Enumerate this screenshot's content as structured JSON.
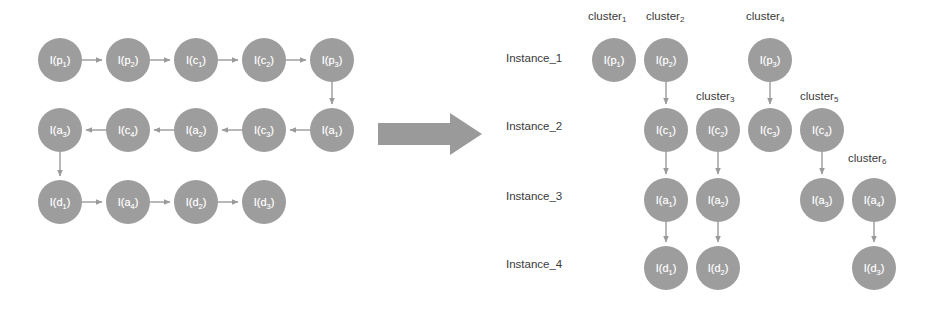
{
  "diagram": {
    "colors": {
      "node_fill": "#9d9d9d",
      "node_text": "#ffffff",
      "edge": "#9a9a9a",
      "label_text": "#3a3a3a",
      "big_arrow": "#9a9a9a",
      "background": "#ffffff"
    },
    "left_graph": {
      "name": "source-event-log-graph",
      "rows": [
        {
          "direction": "left-to-right",
          "nodes": [
            {
              "id": "L-p1",
              "base": "I(p",
              "sub": "1",
              "close": ")",
              "x": 38,
              "y": 38
            },
            {
              "id": "L-p2",
              "base": "I(p",
              "sub": "2",
              "close": ")",
              "x": 106,
              "y": 38
            },
            {
              "id": "L-c1",
              "base": "I(c",
              "sub": "1",
              "close": ")",
              "x": 174,
              "y": 38
            },
            {
              "id": "L-c2",
              "base": "I(c",
              "sub": "2",
              "close": ")",
              "x": 242,
              "y": 38
            },
            {
              "id": "L-p3",
              "base": "I(p",
              "sub": "3",
              "close": ")",
              "x": 310,
              "y": 38
            }
          ]
        },
        {
          "direction": "right-to-left",
          "nodes": [
            {
              "id": "L-a3",
              "base": "I(a",
              "sub": "3",
              "close": ")",
              "x": 38,
              "y": 108
            },
            {
              "id": "L-c4",
              "base": "I(c",
              "sub": "4",
              "close": ")",
              "x": 106,
              "y": 108
            },
            {
              "id": "L-a2",
              "base": "I(a",
              "sub": "2",
              "close": ")",
              "x": 174,
              "y": 108
            },
            {
              "id": "L-c3",
              "base": "I(c",
              "sub": "3",
              "close": ")",
              "x": 242,
              "y": 108
            },
            {
              "id": "L-a1",
              "base": "I(a",
              "sub": "1",
              "close": ")",
              "x": 310,
              "y": 108
            }
          ]
        },
        {
          "direction": "left-to-right",
          "nodes": [
            {
              "id": "L-d1",
              "base": "I(d",
              "sub": "1",
              "close": ")",
              "x": 38,
              "y": 180
            },
            {
              "id": "L-a4",
              "base": "I(a",
              "sub": "4",
              "close": ")",
              "x": 106,
              "y": 180
            },
            {
              "id": "L-d2",
              "base": "I(d",
              "sub": "2",
              "close": ")",
              "x": 174,
              "y": 180
            },
            {
              "id": "L-d3",
              "base": "I(d",
              "sub": "3",
              "close": ")",
              "x": 242,
              "y": 180
            }
          ]
        }
      ],
      "edges": [
        {
          "from": "L-p1",
          "to": "L-p2",
          "kind": "horizontal-right"
        },
        {
          "from": "L-p2",
          "to": "L-c1",
          "kind": "horizontal-right"
        },
        {
          "from": "L-c1",
          "to": "L-c2",
          "kind": "horizontal-right"
        },
        {
          "from": "L-c2",
          "to": "L-p3",
          "kind": "horizontal-right"
        },
        {
          "from": "L-p3",
          "to": "L-a1",
          "kind": "vertical-down"
        },
        {
          "from": "L-a1",
          "to": "L-c3",
          "kind": "horizontal-left"
        },
        {
          "from": "L-c3",
          "to": "L-a2",
          "kind": "horizontal-left"
        },
        {
          "from": "L-a2",
          "to": "L-c4",
          "kind": "horizontal-left"
        },
        {
          "from": "L-c4",
          "to": "L-a3",
          "kind": "horizontal-left"
        },
        {
          "from": "L-a3",
          "to": "L-d1",
          "kind": "vertical-down"
        },
        {
          "from": "L-d1",
          "to": "L-a4",
          "kind": "horizontal-right"
        },
        {
          "from": "L-a4",
          "to": "L-d2",
          "kind": "horizontal-right"
        },
        {
          "from": "L-d2",
          "to": "L-d3",
          "kind": "horizontal-right"
        }
      ]
    },
    "transform_arrow": {
      "name": "transformation-arrow",
      "direction": "right"
    },
    "right_graph": {
      "name": "clustered-instance-graph",
      "instance_labels": [
        {
          "text": "Instance_1",
          "x": 506,
          "y": 52
        },
        {
          "text": "Instance_2",
          "x": 506,
          "y": 120
        },
        {
          "text": "Instance_3",
          "x": 506,
          "y": 190
        },
        {
          "text": "Instance_4",
          "x": 506,
          "y": 258
        }
      ],
      "cluster_labels": [
        {
          "text": "cluster",
          "sub": "1",
          "x": 588,
          "y": 10
        },
        {
          "text": "cluster",
          "sub": "2",
          "x": 646,
          "y": 10
        },
        {
          "text": "cluster",
          "sub": "4",
          "x": 746,
          "y": 10
        },
        {
          "text": "cluster",
          "sub": "3",
          "x": 696,
          "y": 90
        },
        {
          "text": "cluster",
          "sub": "5",
          "x": 800,
          "y": 90
        },
        {
          "text": "cluster",
          "sub": "6",
          "x": 848,
          "y": 152
        }
      ],
      "columns": [
        {
          "cluster": "cluster1",
          "nodes": [
            {
              "id": "R-p1",
              "base": "I(p",
              "sub": "1",
              "close": ")",
              "x": 592,
              "y": 38
            }
          ]
        },
        {
          "cluster": "cluster2",
          "nodes": [
            {
              "id": "R-p2",
              "base": "I(p",
              "sub": "2",
              "close": ")",
              "x": 644,
              "y": 38
            },
            {
              "id": "R-c1",
              "base": "I(c",
              "sub": "1",
              "close": ")",
              "x": 644,
              "y": 108
            },
            {
              "id": "R-a1",
              "base": "I(a",
              "sub": "1",
              "close": ")",
              "x": 644,
              "y": 178
            },
            {
              "id": "R-d1",
              "base": "I(d",
              "sub": "1",
              "close": ")",
              "x": 644,
              "y": 246
            }
          ]
        },
        {
          "cluster": "cluster3",
          "nodes": [
            {
              "id": "R-c2",
              "base": "I(c",
              "sub": "2",
              "close": ")",
              "x": 696,
              "y": 108
            },
            {
              "id": "R-a2",
              "base": "I(a",
              "sub": "2",
              "close": ")",
              "x": 696,
              "y": 178
            },
            {
              "id": "R-d2",
              "base": "I(d",
              "sub": "2",
              "close": ")",
              "x": 696,
              "y": 246
            }
          ]
        },
        {
          "cluster": "cluster4",
          "nodes": [
            {
              "id": "R-p3",
              "base": "I(p",
              "sub": "3",
              "close": ")",
              "x": 748,
              "y": 38
            },
            {
              "id": "R-c3",
              "base": "I(c",
              "sub": "3",
              "close": ")",
              "x": 748,
              "y": 108
            }
          ]
        },
        {
          "cluster": "cluster5",
          "nodes": [
            {
              "id": "R-c4",
              "base": "I(c",
              "sub": "4",
              "close": ")",
              "x": 800,
              "y": 108
            },
            {
              "id": "R-a3",
              "base": "I(a",
              "sub": "3",
              "close": ")",
              "x": 800,
              "y": 178
            }
          ]
        },
        {
          "cluster": "cluster6",
          "nodes": [
            {
              "id": "R-a4",
              "base": "I(a",
              "sub": "4",
              "close": ")",
              "x": 852,
              "y": 178
            },
            {
              "id": "R-d3",
              "base": "I(d",
              "sub": "3",
              "close": ")",
              "x": 852,
              "y": 246
            }
          ]
        }
      ],
      "edges": [
        {
          "from": "R-p2",
          "to": "R-c1",
          "kind": "vertical-down"
        },
        {
          "from": "R-c1",
          "to": "R-a1",
          "kind": "vertical-down"
        },
        {
          "from": "R-a1",
          "to": "R-d1",
          "kind": "vertical-down"
        },
        {
          "from": "R-c2",
          "to": "R-a2",
          "kind": "vertical-down"
        },
        {
          "from": "R-a2",
          "to": "R-d2",
          "kind": "vertical-down"
        },
        {
          "from": "R-p3",
          "to": "R-c3",
          "kind": "vertical-down"
        },
        {
          "from": "R-c4",
          "to": "R-a3",
          "kind": "vertical-down"
        },
        {
          "from": "R-a4",
          "to": "R-d3",
          "kind": "vertical-down"
        }
      ]
    }
  }
}
